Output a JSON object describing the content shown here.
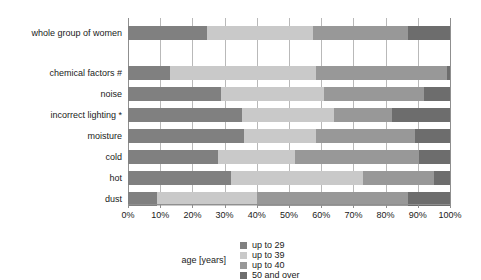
{
  "chart_data": {
    "type": "bar",
    "orientation": "horizontal",
    "stacked": "100%",
    "title": "",
    "xlabel": "",
    "ylabel": "",
    "xlim": [
      0,
      100
    ],
    "grid": true,
    "legend_position": "bottom",
    "legend_title": "age [years]",
    "tick_labels": [
      "0%",
      "10%",
      "20%",
      "30%",
      "40%",
      "50%",
      "60%",
      "70%",
      "80%",
      "90%",
      "100%"
    ],
    "tick_values": [
      0,
      10,
      20,
      30,
      40,
      50,
      60,
      70,
      80,
      90,
      100
    ],
    "categories": [
      "whole group of women",
      "chemical factors #",
      "noise",
      "incorrect lighting *",
      "moisture",
      "cold",
      "hot",
      "dust"
    ],
    "series": [
      {
        "name": "up to 29",
        "color": "#808080",
        "values": [
          24.5,
          13.0,
          29.0,
          35.5,
          36.0,
          28.0,
          32.0,
          9.0
        ]
      },
      {
        "name": "up to 39",
        "color": "#c9c9c9",
        "values": [
          33.0,
          45.5,
          32.0,
          28.5,
          22.5,
          24.0,
          41.0,
          31.0
        ]
      },
      {
        "name": "up to 40",
        "color": "#989898",
        "values": [
          29.5,
          40.5,
          31.0,
          18.0,
          30.5,
          38.5,
          22.0,
          47.0
        ]
      },
      {
        "name": "50 and over",
        "color": "#6d6d6d",
        "values": [
          13.0,
          1.0,
          8.0,
          18.0,
          11.0,
          9.5,
          5.0,
          13.0
        ]
      }
    ]
  }
}
